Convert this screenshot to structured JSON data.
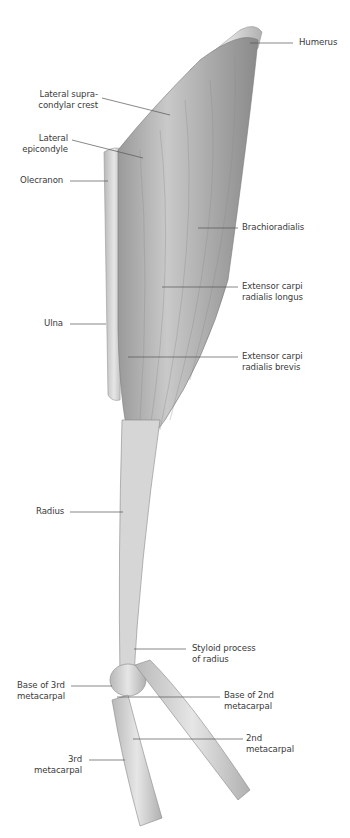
{
  "figure": {
    "background": "#ffffff",
    "label_color": "#3a3a3a",
    "line_color": "#555555"
  },
  "labels": {
    "humerus": "Humerus",
    "lateral_supracondylar_crest": "Lateral supra-\ncondylar crest",
    "lateral_epicondyle": "Lateral\nepicondyle",
    "olecranon": "Olecranon",
    "brachioradialis": "Brachioradialis",
    "ecrl": "Extensor carpi\nradialis longus",
    "ulna": "Ulna",
    "ecrb": "Extensor carpi\nradialis brevis",
    "radius": "Radius",
    "styloid_process": "Styloid process\nof radius",
    "base_3rd_metacarpal": "Base of 3rd\nmetacarpal",
    "base_2nd_metacarpal": "Base of 2nd\nmetacarpal",
    "second_metacarpal": "2nd\nmetacarpal",
    "third_metacarpal": "3rd\nmetacarpal"
  }
}
